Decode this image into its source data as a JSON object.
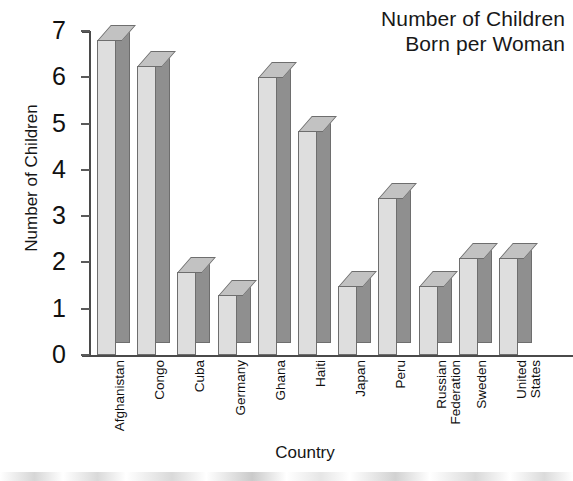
{
  "chart_data": {
    "type": "bar",
    "title": "Number of Children Born per Woman",
    "title_line1": "Number of Children",
    "title_line2": "Born per Woman",
    "xlabel": "Country",
    "ylabel": "Number of Children",
    "ylim": [
      0,
      7
    ],
    "ytick_labels": [
      "7",
      "6",
      "5",
      "4",
      "3",
      "2",
      "1",
      "0"
    ],
    "ytick_values": [
      7,
      6,
      5,
      4,
      3,
      2,
      1,
      0
    ],
    "grid": false,
    "legend": false,
    "style": "3d-bars",
    "categories": [
      "Afghanistan",
      "Congo",
      "Cuba",
      "Germany",
      "Ghana",
      "Haiti",
      "Japan",
      "Peru",
      "Russian Federation",
      "Sweden",
      "United States"
    ],
    "category_label_lines": [
      "Afghanistan",
      "Congo",
      "Cuba",
      "Germany",
      "Ghana",
      "Haiti",
      "Japan",
      "Peru",
      "Russian\nFederation",
      "Sweden",
      "United\nStates"
    ],
    "values": [
      6.8,
      6.25,
      1.8,
      1.3,
      6.0,
      4.85,
      1.5,
      3.4,
      1.5,
      2.1,
      2.1
    ],
    "colors": {
      "bar_front": "#dedede",
      "bar_side": "#8f8f8f",
      "bar_top": "#c2c2c2",
      "bar_outline": "#6e6e6e",
      "axis": "#4a4a4a",
      "text": "#111111",
      "background": "#ffffff"
    }
  }
}
